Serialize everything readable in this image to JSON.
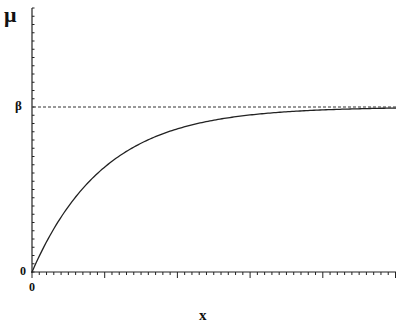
{
  "chart_data": {
    "type": "line",
    "title": "",
    "xlabel": "x",
    "ylabel": "μ",
    "y_tick_labels": [
      "0",
      "β"
    ],
    "x_tick_labels": [
      "0"
    ],
    "series": [
      {
        "name": "μ(x) = β(1 − e^(−kx))",
        "style": "solid",
        "x": [
          0,
          0.5,
          1,
          1.5,
          2,
          3,
          4,
          5
        ],
        "values": [
          0,
          0.39,
          0.63,
          0.78,
          0.86,
          0.95,
          0.98,
          0.99
        ]
      },
      {
        "name": "asymptote β",
        "style": "dashed",
        "x": [
          0,
          5
        ],
        "values": [
          1,
          1
        ]
      }
    ],
    "grid": false,
    "legend": "none"
  },
  "labels": {
    "y_axis": "μ",
    "x_axis": "x",
    "beta": "β",
    "y_zero": "0",
    "x_zero": "0"
  },
  "colors": {
    "curve": "#222222",
    "axis": "#222222",
    "asymptote": "#333333"
  }
}
